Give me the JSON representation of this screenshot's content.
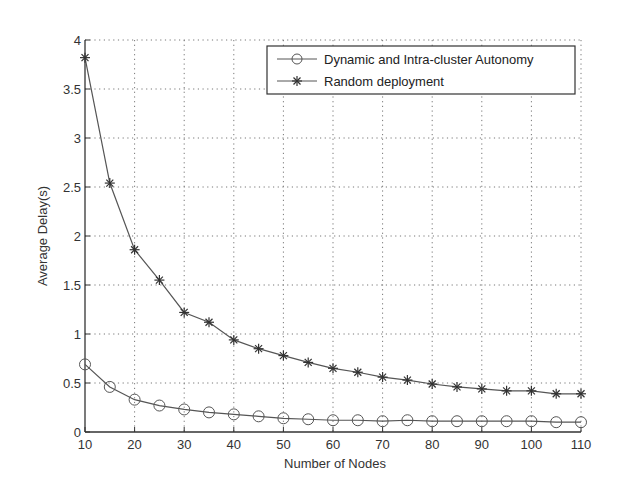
{
  "chart_data": {
    "type": "line",
    "title": "",
    "xlabel": "Number of Nodes",
    "ylabel": "Average Delay(s)",
    "xlim": [
      10,
      110
    ],
    "ylim": [
      0,
      4
    ],
    "grid": true,
    "legend_position": "upper right",
    "x": [
      10,
      15,
      20,
      25,
      30,
      35,
      40,
      45,
      50,
      55,
      60,
      65,
      70,
      75,
      80,
      85,
      90,
      95,
      100,
      105,
      110
    ],
    "xticks": [
      10,
      20,
      30,
      40,
      50,
      60,
      70,
      80,
      90,
      100,
      110
    ],
    "yticks": [
      0,
      0.5,
      1,
      1.5,
      2,
      2.5,
      3,
      3.5,
      4
    ],
    "series": [
      {
        "name": "Dynamic and Intra-cluster Autonomy",
        "marker": "circle",
        "values": [
          0.69,
          0.46,
          0.33,
          0.27,
          0.23,
          0.2,
          0.18,
          0.16,
          0.14,
          0.13,
          0.12,
          0.12,
          0.11,
          0.12,
          0.11,
          0.11,
          0.11,
          0.11,
          0.11,
          0.1,
          0.1
        ]
      },
      {
        "name": "Random deployment",
        "marker": "star",
        "values": [
          3.82,
          2.54,
          1.86,
          1.55,
          1.22,
          1.12,
          0.94,
          0.85,
          0.78,
          0.71,
          0.65,
          0.61,
          0.56,
          0.53,
          0.49,
          0.46,
          0.44,
          0.42,
          0.42,
          0.39,
          0.39
        ]
      }
    ]
  },
  "legend": {
    "items": [
      {
        "label": "Dynamic and Intra-cluster Autonomy"
      },
      {
        "label": "Random deployment"
      }
    ]
  },
  "axes": {
    "xlabel": "Number of Nodes",
    "ylabel": "Average Delay(s)"
  },
  "colors": {
    "line": "#555555",
    "grid": "#777777",
    "axis": "#333333"
  }
}
